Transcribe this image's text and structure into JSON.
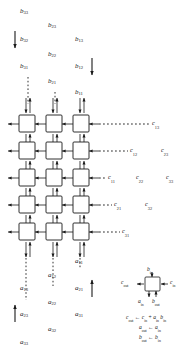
{
  "figure": {
    "kind": "systolic-array-matrix-multiplication",
    "grid": {
      "rows": 5,
      "cols": 3
    },
    "colors": {
      "stroke": "#1a1a1a",
      "background": "#ffffff",
      "cell_fill": "#ffffff"
    }
  },
  "b_inputs": {
    "note": "B matrix elements entering from the top, skewed",
    "items": [
      {
        "base": "b",
        "sub": "33",
        "x": 20,
        "y": 8
      },
      {
        "base": "b",
        "sub": "23",
        "x": 48,
        "y": 22
      },
      {
        "base": "b",
        "sub": "32",
        "x": 20,
        "y": 36
      },
      {
        "base": "b",
        "sub": "13",
        "x": 75,
        "y": 36
      },
      {
        "base": "b",
        "sub": "22",
        "x": 48,
        "y": 51
      },
      {
        "base": "b",
        "sub": "31",
        "x": 20,
        "y": 63
      },
      {
        "base": "b",
        "sub": "12",
        "x": 75,
        "y": 63
      },
      {
        "base": "b",
        "sub": "21",
        "x": 48,
        "y": 78
      },
      {
        "base": "b",
        "sub": "11",
        "x": 75,
        "y": 89
      }
    ]
  },
  "a_inputs": {
    "note": "A matrix elements entering from the bottom, skewed",
    "items": [
      {
        "base": "a",
        "sub": "11",
        "x": 75,
        "y": 258
      },
      {
        "base": "a",
        "sub": "12",
        "x": 48,
        "y": 272
      },
      {
        "base": "a",
        "sub": "21",
        "x": 75,
        "y": 285
      },
      {
        "base": "a",
        "sub": "13",
        "x": 20,
        "y": 285
      },
      {
        "base": "a",
        "sub": "22",
        "x": 48,
        "y": 299
      },
      {
        "base": "a",
        "sub": "31",
        "x": 75,
        "y": 311
      },
      {
        "base": "a",
        "sub": "23",
        "x": 20,
        "y": 311
      },
      {
        "base": "a",
        "sub": "32",
        "x": 48,
        "y": 326
      },
      {
        "base": "a",
        "sub": "33",
        "x": 20,
        "y": 339
      }
    ]
  },
  "c_outputs": {
    "note": "C matrix results leaving to the right, skewed",
    "items": [
      {
        "base": "c",
        "sub": "13",
        "x": 152,
        "y": 124
      },
      {
        "base": "c",
        "sub": "12",
        "x": 130,
        "y": 150
      },
      {
        "base": "c",
        "sub": "23",
        "x": 161,
        "y": 150
      },
      {
        "base": "c",
        "sub": "11",
        "x": 108,
        "y": 177
      },
      {
        "base": "c",
        "sub": "22",
        "x": 136,
        "y": 177
      },
      {
        "base": "c",
        "sub": "33",
        "x": 166,
        "y": 177
      },
      {
        "base": "c",
        "sub": "21",
        "x": 114,
        "y": 204
      },
      {
        "base": "c",
        "sub": "32",
        "x": 145,
        "y": 204
      },
      {
        "base": "c",
        "sub": "31",
        "x": 122,
        "y": 231
      }
    ]
  },
  "legend": {
    "cell_ports": [
      {
        "name": "b_in",
        "base": "b",
        "sub": "in",
        "x": 147,
        "y": 272
      },
      {
        "name": "c_out",
        "base": "c",
        "sub": "out",
        "x": 125,
        "y": 283
      },
      {
        "name": "c_in",
        "base": "c",
        "sub": "in",
        "x": 170,
        "y": 283
      },
      {
        "name": "a_in",
        "base": "a",
        "sub": "in",
        "x": 141,
        "y": 301
      },
      {
        "name": "b_out",
        "base": "b",
        "sub": "out",
        "x": 152,
        "y": 301
      }
    ],
    "formulas": [
      {
        "lhs_base": "c",
        "lhs_sub": "out",
        "arrow": "←",
        "rhs": "c_in + a_in b_in",
        "x": 129,
        "y": 318
      },
      {
        "lhs_base": "a",
        "lhs_sub": "out",
        "arrow": "←",
        "rhs": "a_in",
        "x": 140,
        "y": 328
      },
      {
        "lhs_base": "b",
        "lhs_sub": "out",
        "arrow": "←",
        "rhs": "b_in",
        "x": 140,
        "y": 338
      }
    ]
  },
  "flow_arrows": [
    {
      "name": "b-flow-down-left",
      "direction": "down"
    },
    {
      "name": "b-flow-down-right",
      "direction": "down"
    },
    {
      "name": "a-flow-up-left",
      "direction": "up"
    },
    {
      "name": "a-flow-up-right",
      "direction": "up"
    }
  ]
}
